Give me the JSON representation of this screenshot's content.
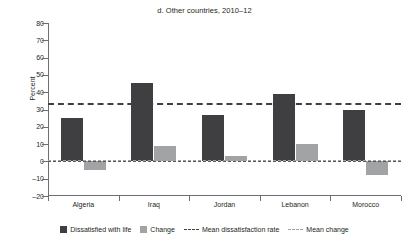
{
  "chart_data": {
    "type": "bar",
    "title": "d. Other countries, 2010–12",
    "xlabel": "",
    "ylabel": "Percent",
    "ylim": [
      -20,
      80
    ],
    "ytick_step": 10,
    "yticks": [
      80,
      70,
      60,
      50,
      40,
      30,
      20,
      10,
      0,
      -10,
      -20
    ],
    "ytick_labels": [
      "80",
      "70",
      "60",
      "50",
      "40",
      "30",
      "20",
      "10",
      "0",
      "–10",
      "–20"
    ],
    "grid": false,
    "legend_position": "bottom",
    "categories": [
      "Algeria",
      "Iraq",
      "Jordan",
      "Lebanon",
      "Morocco"
    ],
    "series": [
      {
        "name": "Dissatisfied with life",
        "color": "#3f3f41",
        "values": [
          25,
          45.5,
          27,
          39,
          30
        ]
      },
      {
        "name": "Change",
        "color": "#a2a3a5",
        "values": [
          -5,
          9,
          3,
          10,
          -8
        ]
      }
    ],
    "reference_lines": [
      {
        "name": "Mean dissatisfaction rate",
        "value": 34,
        "color": "#3f3f41",
        "style": "dashed"
      },
      {
        "name": "Mean change",
        "value": 1,
        "color": "#a2a3a5",
        "style": "dashed"
      }
    ],
    "zero_line": 0
  },
  "legend": {
    "items": [
      {
        "label": "Dissatisfied with life",
        "kind": "swatch",
        "color": "#3f3f41"
      },
      {
        "label": "Change",
        "kind": "swatch",
        "color": "#a2a3a5"
      },
      {
        "label": "Mean dissatisfaction rate",
        "kind": "dash",
        "color": "#3f3f41"
      },
      {
        "label": "Mean change",
        "kind": "dash",
        "color": "#a2a3a5"
      }
    ]
  }
}
